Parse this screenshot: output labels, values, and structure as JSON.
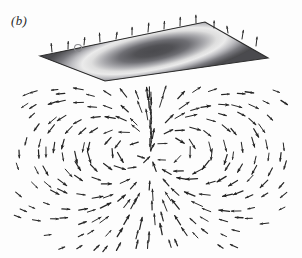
{
  "figure": {
    "panel_label": "(b)",
    "caption_text": "",
    "background_color": "#fdfdfd",
    "width": 302,
    "height": 258
  },
  "chart_data": {
    "type": "scatter",
    "title": "",
    "subtitle": "",
    "xlabel": "",
    "ylabel": "",
    "grid": false,
    "legend_position": "none",
    "xlim": [
      0,
      302
    ],
    "ylim": [
      0,
      258
    ],
    "plane": {
      "name": "source-plane",
      "shape": "parallelogram",
      "vertices": [
        [
          40,
          56
        ],
        [
          205,
          22
        ],
        [
          268,
          58
        ],
        [
          105,
          81
        ]
      ],
      "edge_color": "#2e2e2e",
      "center": [
        152,
        51
      ],
      "contours": [
        {
          "label": "outer-dark-band",
          "rx": 112,
          "ry": 28,
          "color": "#56565a"
        },
        {
          "label": "mid-light-ring",
          "rx": 74,
          "ry": 19,
          "color": "#dcdcdc"
        },
        {
          "label": "inner-dark-core",
          "rx": 44,
          "ry": 11,
          "color": "#5a5a5e"
        }
      ],
      "colors": {
        "darkest": "#3c3c40",
        "dark": "#56565a",
        "mid": "#9a9a9e",
        "light": "#dcdcdc",
        "lightest": "#f0f0f0"
      },
      "marker": {
        "name": "plane-point-marker",
        "position": [
          78,
          48
        ],
        "radius": 3.5,
        "color": "#6e6e72"
      }
    },
    "vector_field": {
      "name": "dipole-vector-field",
      "arrow_color": "#232323",
      "arrow_count": 236,
      "convergence_point": [
        151,
        152
      ],
      "dipole_axis": "vertical",
      "circulation": {
        "left_lobe_center": [
          92,
          160
        ],
        "left_lobe_sense": "counter-clockwise",
        "right_lobe_center": [
          212,
          160
        ],
        "right_lobe_sense": "clockwise"
      },
      "region": {
        "x": 14,
        "y": 86,
        "width": 274,
        "height": 166
      },
      "notes": "Arrows point downward beneath the plane toward the center, then curve outward and back upward along both flanks, producing mirrored circulation lobes characteristic of a dipole."
    }
  }
}
